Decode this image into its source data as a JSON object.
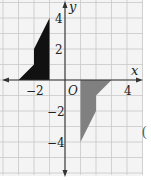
{
  "diagram": {
    "type": "coordinate-plane",
    "origin_px": [
      65,
      80
    ],
    "unit_px": 15.5,
    "grid": {
      "color": "#c8c8c8",
      "extent_px": {
        "x0": 0,
        "x1": 143,
        "y0": 0,
        "y1": 175
      }
    },
    "axes": {
      "x_label": "x",
      "y_label": "y",
      "origin_label": "O",
      "x_ticks": [
        {
          "value": -2,
          "label": "−2"
        },
        {
          "value": 4,
          "label": "4"
        }
      ],
      "y_ticks": [
        {
          "value": 4,
          "label": "4"
        },
        {
          "value": 2,
          "label": "2"
        },
        {
          "value": -2,
          "label": "−2"
        },
        {
          "value": -4,
          "label": "−4"
        }
      ]
    },
    "shapes": [
      {
        "name": "original-figure",
        "fill": "#111111",
        "vertices": [
          [
            -1,
            0
          ],
          [
            -3,
            0
          ],
          [
            -2,
            1
          ],
          [
            -2,
            2
          ],
          [
            -1,
            4
          ]
        ]
      },
      {
        "name": "rotated-image",
        "fill": "#808080",
        "vertices": [
          [
            1,
            0
          ],
          [
            3,
            0
          ],
          [
            2,
            -1
          ],
          [
            2,
            -2
          ],
          [
            1,
            -4
          ]
        ]
      }
    ],
    "stray_mark": "("
  }
}
